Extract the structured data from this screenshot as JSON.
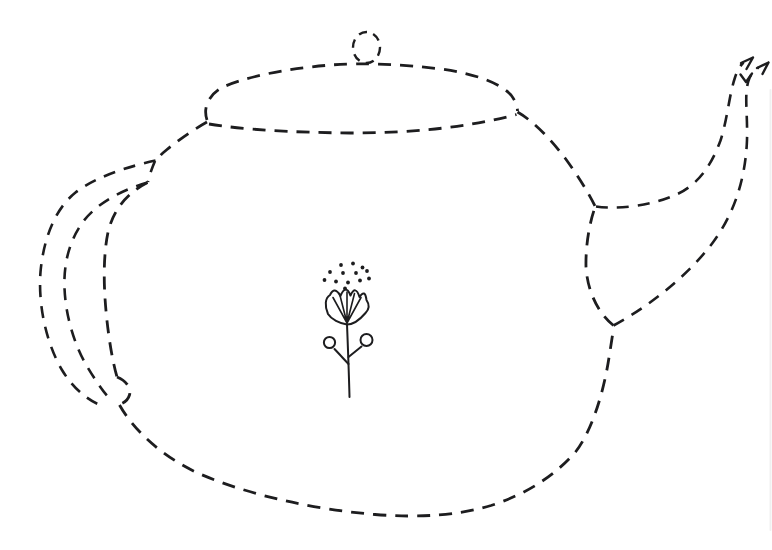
{
  "colors": {
    "ink": "#1d1d1f",
    "background": "#ffffff",
    "artifact": "#c8c8c8"
  },
  "drawing": {
    "subject": "teapot",
    "style": "hand-drawn dashed trace-the-outline worksheet drawing",
    "parts": {
      "knob": "small dashed circle finial on top of lid",
      "lid": "flattened dashed oval lid",
      "body": "large rounded dashed pot body",
      "handle": "three nested dashed C-curves on the left side",
      "spout": "two dashed curves sweeping up to the right, ending in sketchy arrowheads",
      "flower": "small solid-line flower motif with pollen dots at the center of the body"
    }
  },
  "flower": {
    "dot_radius": 1.9,
    "pollen_dots": [
      [
        341,
        265
      ],
      [
        353,
        263.5
      ],
      [
        362.5,
        267.5
      ],
      [
        330,
        272
      ],
      [
        343,
        273
      ],
      [
        356,
        273
      ],
      [
        367,
        271
      ],
      [
        324.5,
        280
      ],
      [
        336,
        281.5
      ],
      [
        348,
        282.5
      ],
      [
        360,
        280.5
      ],
      [
        369,
        278.5
      ],
      [
        345,
        288.5
      ]
    ],
    "petal_scallops": 4,
    "fan_line_count": 5,
    "berry_circles": [
      {
        "cx": 329.5,
        "cy": 342.5,
        "r": 5.6
      },
      {
        "cx": 366.5,
        "cy": 340,
        "r": 6.0
      }
    ]
  }
}
